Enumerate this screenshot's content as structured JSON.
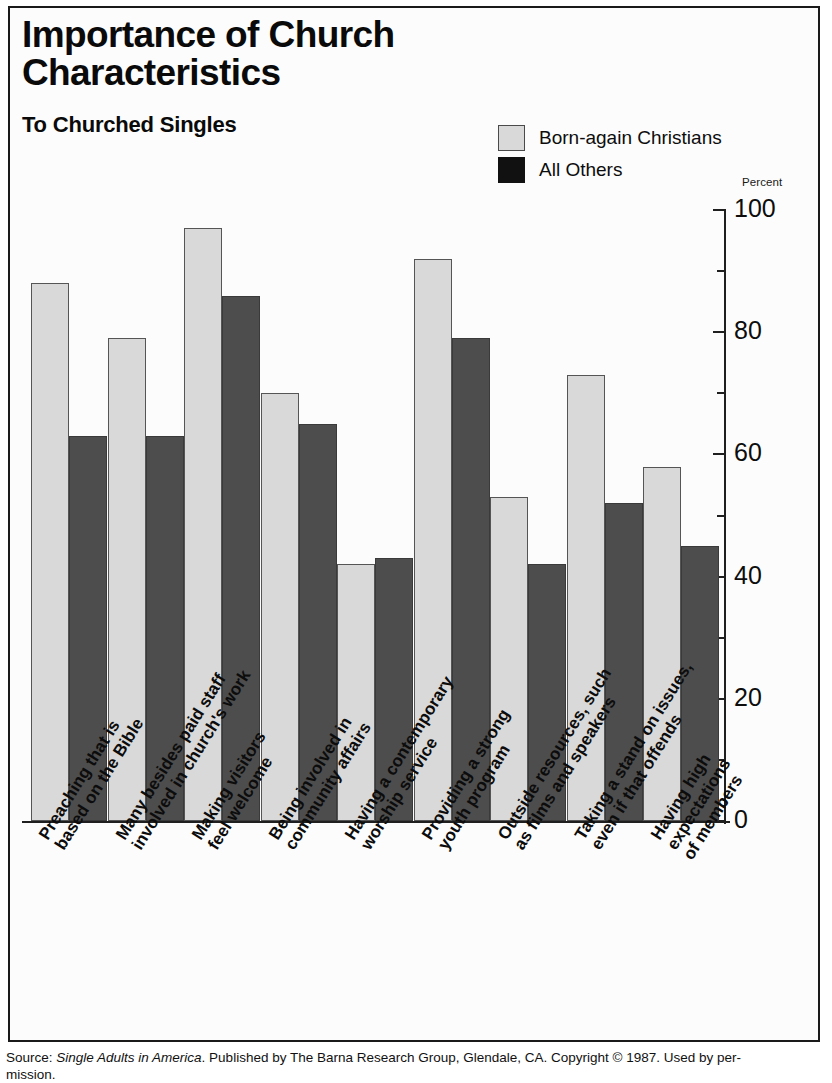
{
  "title": "Importance of Church Characteristics",
  "subtitle": "To Churched Singles",
  "axis_unit_label": "Percent",
  "legend": [
    {
      "label": "Born-again Christians",
      "swatch": "light",
      "color": "#d9d9d9"
    },
    {
      "label": "All Others",
      "swatch": "dark",
      "color": "#111111"
    }
  ],
  "source": {
    "prefix": "Source: ",
    "italic_title": "Single Adults in America",
    "rest": ". Published by The Barna Research Group, Glendale, CA. Copyright © 1987. Used by per-",
    "continuation": "mission."
  },
  "chart_data": {
    "type": "bar",
    "title": "Importance of Church Characteristics",
    "subtitle": "To Churched Singles",
    "xlabel": "",
    "ylabel": "Percent",
    "ylim": [
      0,
      100
    ],
    "ytick_values": [
      0,
      20,
      40,
      60,
      80,
      100
    ],
    "ytick_labels": [
      "0",
      "20",
      "40",
      "60",
      "80",
      "100"
    ],
    "minor_tick_interval": 10,
    "grid": false,
    "legend_position": "top-right",
    "categories": [
      "Preaching that is based on the Bible",
      "Many besides paid staff involved in church's work",
      "Making visitors feel welcome",
      "Being involved in community affairs",
      "Having a contemporary worship service",
      "Providing a strong youth program",
      "Outside resources, such as films and speakers",
      "Taking a stand on issues, even if that offends",
      "Having high expectations of members"
    ],
    "category_lines": [
      [
        "Preaching that is",
        "based on the Bible"
      ],
      [
        "Many besides paid staff",
        "involved in church's work"
      ],
      [
        "Making visitors",
        "feel welcome"
      ],
      [
        "Being involved in",
        "community affairs"
      ],
      [
        "Having a contemporary",
        "worship service"
      ],
      [
        "Providing a strong",
        "youth program"
      ],
      [
        "Outside resources, such",
        "as films and speakers"
      ],
      [
        "Taking a stand on issues,",
        "even if that offends"
      ],
      [
        "Having high expectations",
        "of members"
      ]
    ],
    "series": [
      {
        "name": "Born-again Christians",
        "color": "#d9d9d9",
        "values": [
          88,
          79,
          97,
          70,
          42,
          92,
          53,
          73,
          58
        ]
      },
      {
        "name": "All Others",
        "color": "#4d4d4d",
        "values": [
          63,
          63,
          86,
          65,
          43,
          79,
          42,
          52,
          45
        ]
      }
    ]
  }
}
